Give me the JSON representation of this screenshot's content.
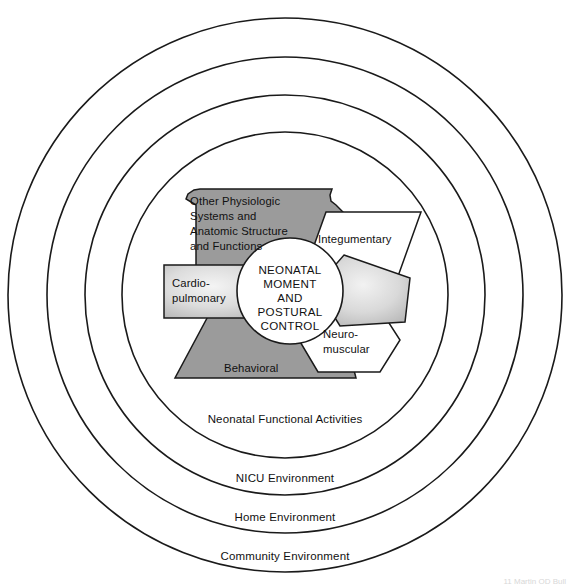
{
  "diagram": {
    "type": "concentric-systems-model",
    "core": {
      "name": "neonatal-core",
      "lines": [
        "NEONATAL",
        "MOMENT",
        "AND",
        "POSTURAL",
        "CONTROL"
      ],
      "full_text": "NEONATAL MOMENT AND POSTURAL CONTROL"
    },
    "rings": [
      {
        "id": "ring-functional-activities",
        "label": "Neonatal Functional Activities",
        "order": 1
      },
      {
        "id": "ring-nicu",
        "label": "NICU Environment",
        "order": 2
      },
      {
        "id": "ring-home",
        "label": "Home Environment",
        "order": 3
      },
      {
        "id": "ring-community",
        "label": "Community Environment",
        "order": 4
      }
    ],
    "subsystems": [
      {
        "id": "other-physiologic",
        "shape": "notched-polygon",
        "fill": "dark-gray",
        "position": "upper-left",
        "lines": [
          "Other Physiologic",
          "Systems and",
          "Anatomic Structure",
          "and Functions"
        ],
        "full_text": "Other Physiologic Systems and Anatomic Structure and Functions"
      },
      {
        "id": "cardiopulmonary",
        "shape": "rectangle",
        "fill": "gradient-gray",
        "position": "left",
        "lines": [
          "Cardio-",
          "pulmonary"
        ],
        "full_text": "Cardiopulmonary"
      },
      {
        "id": "behavioral",
        "shape": "trapezoid",
        "fill": "dark-gray",
        "position": "bottom",
        "lines": [
          "Behavioral"
        ],
        "full_text": "Behavioral"
      },
      {
        "id": "integumentary",
        "shape": "parallelogram",
        "fill": "white",
        "position": "upper-right",
        "lines": [
          "Integumentary"
        ],
        "full_text": "Integumentary"
      },
      {
        "id": "neuromuscular",
        "shape": "hexagon",
        "fill": "white",
        "position": "lower-right",
        "lines": [
          "Neuro-",
          "muscular"
        ],
        "full_text": "Neuromuscular"
      },
      {
        "id": "unlabeled-pentagon",
        "shape": "pentagon",
        "fill": "gradient-gray",
        "position": "right",
        "lines": [],
        "full_text": ""
      }
    ],
    "colors": {
      "shape_dark": "#9b9b9b",
      "shape_white": "#ffffff",
      "outline": "#1a1a1a",
      "background": "#ffffff"
    },
    "credit": "11 Martin OD Bull"
  }
}
